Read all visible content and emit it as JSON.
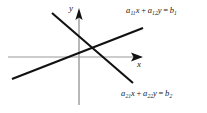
{
  "figure": {
    "type": "diagram",
    "background_color": "#ffffff",
    "width": 207,
    "height": 113,
    "axes": {
      "color": "#9a9a9a",
      "origin": {
        "x": 79,
        "y": 57
      },
      "x_axis": {
        "label": "x",
        "from": {
          "x": 8,
          "y": 57
        },
        "to": {
          "x": 143,
          "y": 57
        },
        "arrow": "right"
      },
      "y_axis": {
        "label": "y",
        "from": {
          "x": 79,
          "y": 105
        },
        "to": {
          "x": 79,
          "y": 8
        },
        "arrow": "up"
      }
    },
    "lines": [
      {
        "name": "line-1",
        "color": "#111111",
        "from": {
          "x": 12,
          "y": 79
        },
        "to": {
          "x": 143,
          "y": 28
        },
        "direction": "ascending"
      },
      {
        "name": "line-2",
        "color": "#111111",
        "from": {
          "x": 52,
          "y": 13
        },
        "to": {
          "x": 133,
          "y": 83
        },
        "direction": "descending"
      }
    ],
    "intersection": {
      "x": 90,
      "y": 47
    },
    "equations": {
      "top": {
        "coef_1": "a",
        "coef_1_sub": "11",
        "var_1": "x",
        "plus": "+",
        "coef_2": "a",
        "coef_2_sub": "12",
        "var_2": "y",
        "equals": "=",
        "rhs": "b",
        "rhs_sub": "1",
        "full_text": "a11x + a12y = b1"
      },
      "bottom": {
        "coef_1": "a",
        "coef_1_sub": "21",
        "var_1": "x",
        "plus": "+",
        "coef_2": "a",
        "coef_2_sub": "22",
        "var_2": "y",
        "equals": "=",
        "rhs": "b",
        "rhs_sub": "2",
        "full_text": "a21x + a22y = b2"
      }
    }
  }
}
